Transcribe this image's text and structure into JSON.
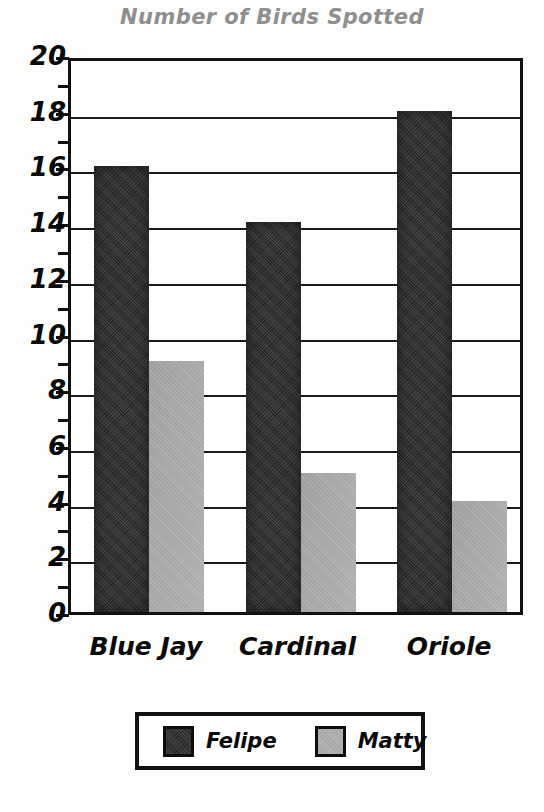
{
  "chart_data": {
    "type": "bar",
    "title": "Number of Birds Spotted",
    "xlabel": "",
    "ylabel": "",
    "categories": [
      "Blue Jay",
      "Cardinal",
      "Oriole"
    ],
    "series": [
      {
        "name": "Felipe",
        "color": "#2f2f2f",
        "values": [
          16,
          14,
          18
        ]
      },
      {
        "name": "Matty",
        "color": "#a9a9a9",
        "values": [
          9,
          5,
          4
        ]
      }
    ],
    "ylim": [
      0,
      20
    ],
    "y_major_ticks": [
      0,
      2,
      4,
      6,
      8,
      10,
      12,
      14,
      16,
      18,
      20
    ],
    "y_minor_ticks": [
      1,
      3,
      5,
      7,
      9,
      11,
      13,
      15,
      17,
      19
    ],
    "y_tick_labels": [
      "0",
      "2",
      "4",
      "6",
      "8",
      "10",
      "12",
      "14",
      "16",
      "18",
      "20"
    ],
    "grid": "horizontal",
    "legend_position": "bottom",
    "legend_entries": [
      "Felipe",
      "Matty"
    ]
  },
  "title": {
    "text": "Number of Birds Spotted",
    "color": "#8f8f8f"
  },
  "legend": {
    "felipe_label": "Felipe",
    "matty_label": "Matty"
  }
}
